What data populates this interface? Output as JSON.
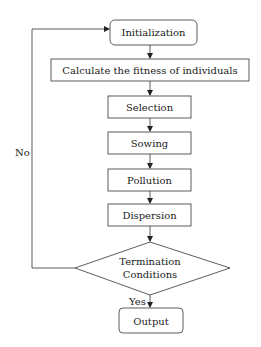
{
  "diagram": {
    "type": "flowchart",
    "colors": {
      "stroke": "#333333",
      "text": "#222222",
      "background": "#ffffff"
    },
    "nodes": {
      "initialization": {
        "label": "Initialization",
        "shape": "rounded-rect"
      },
      "fitness": {
        "label": "Calculate the fitness of individuals",
        "shape": "rect"
      },
      "selection": {
        "label": "Selection",
        "shape": "rect"
      },
      "sowing": {
        "label": "Sowing",
        "shape": "rect"
      },
      "pollution": {
        "label": "Pollution",
        "shape": "rect"
      },
      "dispersion": {
        "label": "Dispersion",
        "shape": "rect"
      },
      "termination": {
        "label_line1": "Termination",
        "label_line2": "Conditions",
        "shape": "diamond"
      },
      "output": {
        "label": "Output",
        "shape": "rounded-rect"
      }
    },
    "edges": {
      "yes_label": "Yes",
      "no_label": "No"
    }
  }
}
